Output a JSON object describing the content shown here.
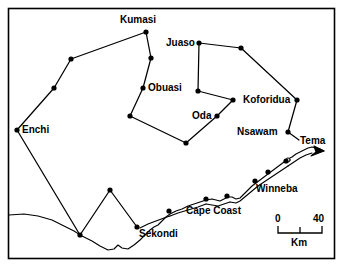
{
  "figure": {
    "type": "map",
    "region": "Southern Ghana",
    "border_color": "#000000",
    "line_color": "#000000",
    "node_color": "#000000",
    "background_color": "#ffffff"
  },
  "labels": [
    {
      "id": "kumasi",
      "text": "Kumasi",
      "x": 120,
      "y": 14
    },
    {
      "id": "juaso",
      "text": "Juaso",
      "x": 166,
      "y": 37
    },
    {
      "id": "obuasi",
      "text": "Obuasi",
      "x": 148,
      "y": 82
    },
    {
      "id": "oda",
      "text": "Oda",
      "x": 192,
      "y": 110
    },
    {
      "id": "koforidua",
      "text": "Koforidua",
      "x": 245,
      "y": 94
    },
    {
      "id": "nsawam",
      "text": "Nsawam",
      "x": 237,
      "y": 127
    },
    {
      "id": "tema",
      "text": "Tema",
      "x": 300,
      "y": 135
    },
    {
      "id": "enchi",
      "text": "Enchi",
      "x": 22,
      "y": 124
    },
    {
      "id": "winneba",
      "text": "Winneba",
      "x": 256,
      "y": 183
    },
    {
      "id": "capecoast",
      "text": "Cape  Coast",
      "x": 186,
      "y": 205
    },
    {
      "id": "sekondi",
      "text": "Sekondi",
      "x": 139,
      "y": 228
    }
  ],
  "nodes": [
    {
      "id": "kumasi",
      "x": 146,
      "y": 32
    },
    {
      "id": "n-kumasi-nw",
      "x": 71,
      "y": 59
    },
    {
      "id": "n-west-mid",
      "x": 54,
      "y": 88
    },
    {
      "id": "enchi",
      "x": 17,
      "y": 130
    },
    {
      "id": "n-kumasi-s",
      "x": 151,
      "y": 58
    },
    {
      "id": "obuasi",
      "x": 143,
      "y": 88
    },
    {
      "id": "n-obuasi-s",
      "x": 130,
      "y": 116
    },
    {
      "id": "n-basin-s",
      "x": 186,
      "y": 143
    },
    {
      "id": "juaso",
      "x": 199,
      "y": 43
    },
    {
      "id": "n-juaso-e",
      "x": 241,
      "y": 48
    },
    {
      "id": "n-juaso-s",
      "x": 198,
      "y": 91
    },
    {
      "id": "n-oda-ne",
      "x": 233,
      "y": 100
    },
    {
      "id": "oda",
      "x": 217,
      "y": 116
    },
    {
      "id": "koforidua",
      "x": 297,
      "y": 100
    },
    {
      "id": "nsawam",
      "x": 288,
      "y": 132
    },
    {
      "id": "n-sw-coast",
      "x": 80,
      "y": 235
    },
    {
      "id": "n-sw-peak",
      "x": 110,
      "y": 190
    },
    {
      "id": "sekondi",
      "x": 137,
      "y": 227
    },
    {
      "id": "n-coast-1",
      "x": 169,
      "y": 211
    },
    {
      "id": "n-coast-2",
      "x": 206,
      "y": 199
    },
    {
      "id": "n-coast-3",
      "x": 227,
      "y": 196
    },
    {
      "id": "winneba",
      "x": 255,
      "y": 181
    },
    {
      "id": "n-coast-4",
      "x": 268,
      "y": 172
    },
    {
      "id": "n-coast-5",
      "x": 286,
      "y": 161
    }
  ],
  "scale_bar": {
    "start_label": "0",
    "end_label": "40",
    "unit_label": "Km",
    "start_label_x": 278,
    "start_label_y": 215,
    "end_label_x": 311,
    "end_label_y": 215,
    "unit_label_x": 292,
    "unit_label_y": 240,
    "bar_x1": 278,
    "bar_x2": 322,
    "bar_y": 232
  }
}
